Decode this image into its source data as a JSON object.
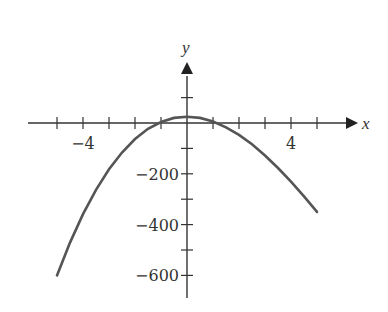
{
  "chart_data": {
    "type": "line",
    "title": "",
    "xlabel": "x",
    "ylabel": "y",
    "xlim": [
      -5.2,
      5.6
    ],
    "ylim": [
      -690,
      200
    ],
    "grid": false,
    "legend": null,
    "x_ticks": [
      -5,
      -4,
      -3,
      -2,
      -1,
      0,
      1,
      2,
      3,
      4,
      5
    ],
    "x_tick_labels": [
      {
        "value": -4,
        "text": "−4"
      },
      {
        "value": 4,
        "text": "4"
      }
    ],
    "y_ticks": [
      100,
      0,
      -100,
      -200,
      -300,
      -400,
      -500,
      -600
    ],
    "y_tick_labels": [
      {
        "value": -200,
        "text": "−200"
      },
      {
        "value": -400,
        "text": "−400"
      },
      {
        "value": -600,
        "text": "−600"
      }
    ],
    "series": [
      {
        "name": "f(x)",
        "color": "#555555",
        "x": [
          -5,
          -4.5,
          -4,
          -3.5,
          -3,
          -2.5,
          -2,
          -1.5,
          -1,
          -0.5,
          0,
          0.5,
          1,
          1.5,
          2,
          2.5,
          3,
          3.5,
          4,
          4.5,
          5
        ],
        "y": [
          -600,
          -471,
          -359,
          -263,
          -182,
          -116,
          -63,
          -23,
          4,
          20,
          25,
          20,
          6,
          -17,
          -47,
          -84,
          -128,
          -177,
          -231,
          -289,
          -350
        ]
      }
    ]
  },
  "colors": {
    "axis": "#333333",
    "curve": "#555555",
    "background": "#ffffff"
  }
}
